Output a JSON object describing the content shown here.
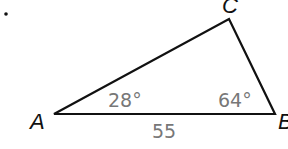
{
  "problem_marker": ".",
  "triangle": {
    "vertices": [
      {
        "name": "A",
        "x": 54,
        "y": 114
      },
      {
        "name": "B",
        "x": 275,
        "y": 114
      },
      {
        "name": "C",
        "x": 229,
        "y": 19
      }
    ],
    "labels": {
      "A": "A",
      "B": "B",
      "C": "C"
    },
    "angles": {
      "A": "28°",
      "B": "64°"
    },
    "sides": {
      "AB": "55"
    },
    "line_color": "#111111",
    "measure_color": "#777777"
  }
}
